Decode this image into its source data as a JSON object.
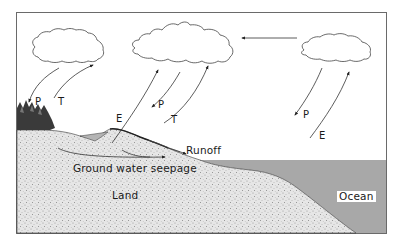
{
  "diagram": {
    "colors": {
      "frame": "#6a6a6a",
      "land_fill": "#e4e4e4",
      "land_speckle": "#8a8a8a",
      "ocean_fill": "#a8a8a8",
      "pond_fill": "#b4b4b4",
      "line": "#333333",
      "background": "#ffffff"
    },
    "clouds": [
      {
        "id": "left-cloud"
      },
      {
        "id": "middle-cloud"
      },
      {
        "id": "right-cloud"
      }
    ],
    "labels": {
      "left_precipitation": "P",
      "left_transpiration": "T",
      "middle_evaporation": "E",
      "middle_precipitation": "P",
      "middle_transpiration": "T",
      "right_precipitation": "P",
      "right_evaporation": "E",
      "runoff": "Runoff",
      "ground_water": "Ground water seepage",
      "land": "Land",
      "ocean": "Ocean"
    }
  }
}
